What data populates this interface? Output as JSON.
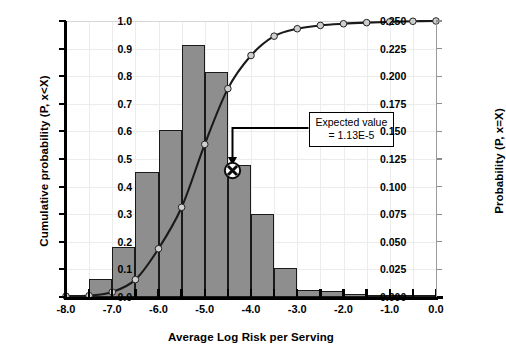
{
  "chart_data": {
    "type": "bar",
    "title": "",
    "xlabel": "Average Log Risk per Serving",
    "ylabel": "Cumulative probability (P, x<X)",
    "y2label": "Probability (P, x=X)",
    "xlim": [
      -8.0,
      0.0
    ],
    "ylim": [
      0.0,
      1.0
    ],
    "y2lim": [
      0.0,
      0.25
    ],
    "grid": true,
    "legend": "none",
    "x_ticks": [
      -8.0,
      -7.5,
      -7.0,
      -6.5,
      -6.0,
      -5.5,
      -5.0,
      -4.5,
      -4.0,
      -3.5,
      -3.0,
      -2.5,
      -2.0,
      -1.5,
      -1.0,
      -0.5,
      0.0
    ],
    "x_tick_labels": [
      "-8.0",
      "",
      "-7.0",
      "",
      "-6.0",
      "",
      "-5.0",
      "",
      "-4.0",
      "",
      "-3.0",
      "",
      "-2.0",
      "",
      "-1.0",
      "",
      "0.0"
    ],
    "y_ticks": [
      0.0,
      0.1,
      0.2,
      0.3,
      0.4,
      0.5,
      0.6,
      0.7,
      0.8,
      0.9,
      1.0
    ],
    "y_tick_labels": [
      "0.0",
      "0.1",
      "0.2",
      "0.3",
      "0.4",
      "0.5",
      "0.6",
      "0.7",
      "0.8",
      "0.9",
      "1.0"
    ],
    "y2_ticks": [
      0.0,
      0.025,
      0.05,
      0.075,
      0.1,
      0.125,
      0.15,
      0.175,
      0.2,
      0.225,
      0.25
    ],
    "y2_tick_labels": [
      "0.000",
      "0.025",
      "0.050",
      "0.075",
      "0.100",
      "0.125",
      "0.150",
      "0.175",
      "0.200",
      "0.225",
      "0.250"
    ],
    "bin_width": 0.5,
    "series": [
      {
        "name": "Probability (P, x=X)",
        "type": "bar",
        "axis": "right",
        "color": "#8e8e8e",
        "bin_centers": [
          -7.25,
          -6.75,
          -6.25,
          -5.75,
          -5.25,
          -4.75,
          -4.25,
          -3.75,
          -3.25,
          -2.75,
          -2.25,
          -1.75,
          -1.25,
          -0.75,
          -0.25
        ],
        "values": [
          0.016,
          0.045,
          0.113,
          0.151,
          0.228,
          0.204,
          0.12,
          0.075,
          0.026,
          0.006,
          0.005,
          0.003,
          0.002,
          0.001,
          0.0
        ]
      },
      {
        "name": "Cumulative probability (P, x<X)",
        "type": "line",
        "axis": "left",
        "marker": "circle",
        "color": "#1a1a1a",
        "x": [
          -8.0,
          -7.5,
          -7.0,
          -6.5,
          -6.0,
          -5.5,
          -5.0,
          -4.5,
          -4.0,
          -3.5,
          -3.0,
          -2.5,
          -2.0,
          -1.5,
          -1.0,
          -0.5,
          0.0
        ],
        "values": [
          0.003,
          0.005,
          0.018,
          0.063,
          0.175,
          0.325,
          0.553,
          0.755,
          0.875,
          0.945,
          0.972,
          0.984,
          0.99,
          0.994,
          0.997,
          0.999,
          1.0
        ]
      }
    ],
    "annotations": [
      {
        "name": "expected-value",
        "text_line1": "Expected value",
        "text_line2": "= 1.13E-5",
        "marker_x": -4.4,
        "marker_y": 0.46,
        "marker_style": "circled-x"
      }
    ]
  }
}
